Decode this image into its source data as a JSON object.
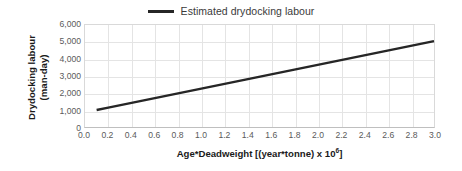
{
  "chart_data": {
    "type": "line",
    "title": "",
    "subtitle": "",
    "xlabel_text_before_exponent": "Age*Deadweight [(year*tonne) x 10",
    "xlabel_exponent": "6",
    "xlabel_text_after_exponent": "]",
    "xlabel": "Age*Deadweight [(year*tonne) x 10^6]",
    "ylabel_line1": "Drydocking labour",
    "ylabel_line2": "(man-day)",
    "ylabel": "Drydocking labour (man-day)",
    "xlim": [
      0.0,
      3.0
    ],
    "ylim": [
      0,
      6000
    ],
    "grid": true,
    "legend_position": "top-center",
    "x_tick_labels": [
      "0.0",
      "0.2",
      "0.4",
      "0.6",
      "0.8",
      "1.0",
      "1.2",
      "1.4",
      "1.6",
      "1.8",
      "2.0",
      "2.2",
      "2.4",
      "2.6",
      "2.8",
      "3.0"
    ],
    "x_tick_values": [
      0.0,
      0.2,
      0.4,
      0.6,
      0.8,
      1.0,
      1.2,
      1.4,
      1.6,
      1.8,
      2.0,
      2.2,
      2.4,
      2.6,
      2.8,
      3.0
    ],
    "y_tick_labels": [
      "0",
      "1,000",
      "2,000",
      "3,000",
      "4,000",
      "5,000",
      "6,000"
    ],
    "y_tick_values": [
      0,
      1000,
      2000,
      3000,
      4000,
      5000,
      6000
    ],
    "series": [
      {
        "name": "Estimated drydocking labour",
        "color": "#262626",
        "line_width": 2.4,
        "x": [
          0.1,
          0.2,
          0.4,
          0.6,
          0.8,
          1.0,
          1.2,
          1.4,
          1.6,
          1.8,
          2.0,
          2.2,
          2.4,
          2.6,
          2.8,
          3.0
        ],
        "values": [
          1000,
          1140,
          1419,
          1698,
          1978,
          2257,
          2536,
          2816,
          3095,
          3374,
          3653,
          3933,
          4212,
          4491,
          4771,
          5050
        ]
      }
    ]
  },
  "legend": {
    "entries": [
      {
        "label": "Estimated drydocking labour",
        "color": "#262626"
      }
    ]
  },
  "axes": {
    "y_title_line1": "Drydocking labour",
    "y_title_line2": "(man-day)",
    "x_title_prefix": "Age*Deadweight [(year*tonne) x 10",
    "x_title_exponent": "6",
    "x_title_suffix": "]"
  }
}
